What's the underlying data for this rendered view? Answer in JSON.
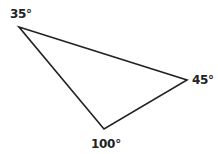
{
  "diagram": {
    "type": "triangle",
    "stroke_color": "#222222",
    "stroke_width": 1.6,
    "vertices": [
      {
        "id": "A",
        "x": 19,
        "y": 27,
        "angle_label": "35°"
      },
      {
        "id": "B",
        "x": 187,
        "y": 80,
        "angle_label": "45°"
      },
      {
        "id": "C",
        "x": 104,
        "y": 129,
        "angle_label": "100°"
      }
    ]
  }
}
